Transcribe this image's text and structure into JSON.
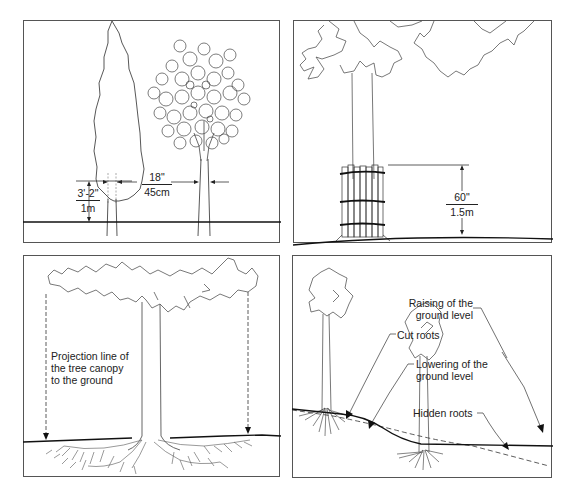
{
  "figure": {
    "panels": [
      {
        "id": "panel-1",
        "subject": "Tree trunk diameter measurement height",
        "measurements": {
          "height": {
            "imperial": "3'-2\"",
            "metric": "1m"
          },
          "diameter": {
            "imperial": "18\"",
            "metric": "45cm"
          }
        }
      },
      {
        "id": "panel-2",
        "subject": "Trunk protection with wooden planks",
        "measurements": {
          "protection_height": {
            "imperial": "60\"",
            "metric": "1.5m"
          }
        }
      },
      {
        "id": "panel-3",
        "subject": "Canopy projection onto ground",
        "labels": {
          "projection_line": [
            "Projection line of",
            "the tree canopy",
            "to the ground"
          ]
        }
      },
      {
        "id": "panel-4",
        "subject": "Changes of ground level affecting roots",
        "labels": {
          "raising": [
            "Raising of the",
            "ground level"
          ],
          "cut_roots": "Cut roots",
          "lowering": [
            "Lowering of the",
            "ground level"
          ],
          "hidden_roots": "Hidden roots"
        }
      }
    ],
    "colors": {
      "line": "#333333",
      "border": "#555555",
      "text": "#222222",
      "background": "#ffffff"
    }
  }
}
